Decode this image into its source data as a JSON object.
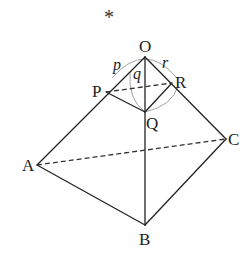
{
  "figure": {
    "marker": "*",
    "points": {
      "O": {
        "label": "O",
        "x": 145,
        "y": 57
      },
      "P": {
        "label": "P",
        "x": 106,
        "y": 92
      },
      "Q": {
        "label": "Q",
        "x": 145,
        "y": 112
      },
      "R": {
        "label": "R",
        "x": 172,
        "y": 83
      },
      "A": {
        "label": "A",
        "x": 37,
        "y": 165
      },
      "B": {
        "label": "B",
        "x": 145,
        "y": 225
      },
      "C": {
        "label": "C",
        "x": 226,
        "y": 139
      }
    },
    "angle_labels": {
      "p": "p",
      "q": "q",
      "r": "r"
    },
    "solid_edges": [
      "OA",
      "OB",
      "OC",
      "AB",
      "BC",
      "PQ",
      "QR"
    ],
    "dashed_edges": [
      "PR",
      "AC"
    ]
  }
}
